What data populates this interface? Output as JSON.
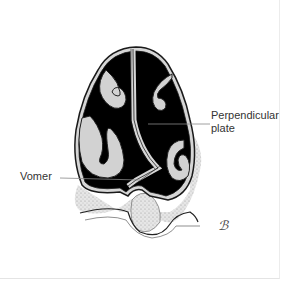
{
  "diagram": {
    "labels": [
      {
        "id": "perpendicular_plate",
        "text_line1": "Perpendicular",
        "text_line2": "plate"
      },
      {
        "id": "vomer",
        "text": "Vomer"
      }
    ],
    "signature": "ℬ"
  },
  "colors": {
    "cavity": "#000000",
    "tissue": "#d9d9d9",
    "outline": "#1a1a1a",
    "leader_line": "#888888",
    "background": "#ffffff"
  }
}
